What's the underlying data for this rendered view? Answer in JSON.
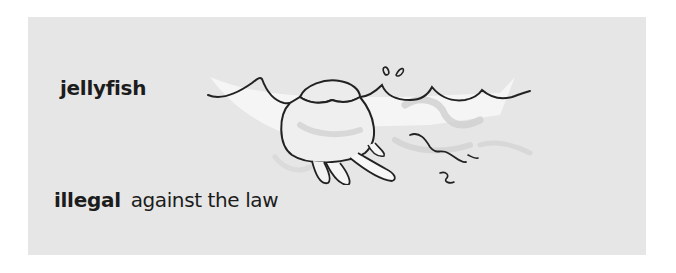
{
  "panel": {
    "background": "#e6e6e6"
  },
  "entries": [
    {
      "word": "jellyfish",
      "definition": "",
      "illustration": "jellyfish-in-water-drawing"
    },
    {
      "word": "illegal",
      "definition": "against the law"
    }
  ],
  "colors": {
    "text": "#1c1c1c",
    "line": "#222222",
    "water_highlight": "#f6f6f6",
    "shadow": "#c9c9c9"
  }
}
